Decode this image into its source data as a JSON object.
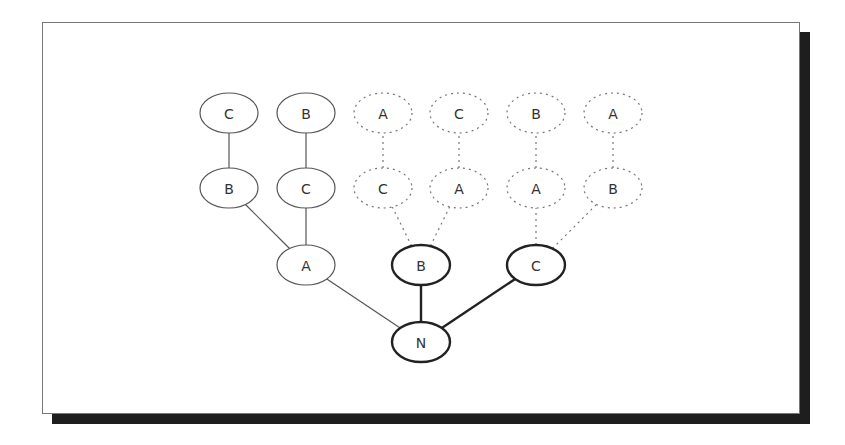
{
  "diagram": {
    "type": "search-tree",
    "root": {
      "id": "N",
      "label": "N",
      "x": 421,
      "y": 342,
      "style": "bold"
    },
    "nodes": [
      {
        "id": "l1a",
        "label": "A",
        "x": 306,
        "y": 265,
        "style": "thin"
      },
      {
        "id": "l1b",
        "label": "B",
        "x": 421,
        "y": 265,
        "style": "bold"
      },
      {
        "id": "l1c",
        "label": "C",
        "x": 536,
        "y": 265,
        "style": "bold"
      },
      {
        "id": "l2ab",
        "label": "B",
        "x": 229,
        "y": 188,
        "style": "thin"
      },
      {
        "id": "l2ac",
        "label": "C",
        "x": 306,
        "y": 188,
        "style": "thin"
      },
      {
        "id": "l2bc",
        "label": "C",
        "x": 383,
        "y": 188,
        "style": "dotted"
      },
      {
        "id": "l2ba",
        "label": "A",
        "x": 459,
        "y": 188,
        "style": "dotted"
      },
      {
        "id": "l2ca",
        "label": "A",
        "x": 536,
        "y": 188,
        "style": "dotted"
      },
      {
        "id": "l2cb",
        "label": "B",
        "x": 613,
        "y": 188,
        "style": "dotted"
      },
      {
        "id": "l3abc",
        "label": "C",
        "x": 229,
        "y": 113,
        "style": "thin"
      },
      {
        "id": "l3acb",
        "label": "B",
        "x": 306,
        "y": 113,
        "style": "thin"
      },
      {
        "id": "l3bca",
        "label": "A",
        "x": 383,
        "y": 113,
        "style": "dotted"
      },
      {
        "id": "l3bac",
        "label": "C",
        "x": 459,
        "y": 113,
        "style": "dotted"
      },
      {
        "id": "l3cab",
        "label": "B",
        "x": 536,
        "y": 113,
        "style": "dotted"
      },
      {
        "id": "l3cba",
        "label": "A",
        "x": 613,
        "y": 113,
        "style": "dotted"
      }
    ],
    "edges": [
      {
        "from": "N",
        "to": "l1a",
        "style": "thin"
      },
      {
        "from": "N",
        "to": "l1b",
        "style": "bold"
      },
      {
        "from": "N",
        "to": "l1c",
        "style": "bold"
      },
      {
        "from": "l1a",
        "to": "l2ab",
        "style": "thin"
      },
      {
        "from": "l1a",
        "to": "l2ac",
        "style": "thin"
      },
      {
        "from": "l1b",
        "to": "l2bc",
        "style": "dotted"
      },
      {
        "from": "l1b",
        "to": "l2ba",
        "style": "dotted"
      },
      {
        "from": "l1c",
        "to": "l2ca",
        "style": "dotted"
      },
      {
        "from": "l1c",
        "to": "l2cb",
        "style": "dotted"
      },
      {
        "from": "l2ab",
        "to": "l3abc",
        "style": "thin"
      },
      {
        "from": "l2ac",
        "to": "l3acb",
        "style": "thin"
      },
      {
        "from": "l2bc",
        "to": "l3bca",
        "style": "dotted"
      },
      {
        "from": "l2ba",
        "to": "l3bac",
        "style": "dotted"
      },
      {
        "from": "l2ca",
        "to": "l3cab",
        "style": "dotted"
      },
      {
        "from": "l2cb",
        "to": "l3cba",
        "style": "dotted"
      }
    ],
    "node_size": {
      "rx": 29,
      "ry": 20
    },
    "colors": {
      "thin": "#555555",
      "bold": "#222222",
      "dotted": "#777777",
      "shadow": "#1e1e1e",
      "frame_border": "#777777"
    }
  }
}
